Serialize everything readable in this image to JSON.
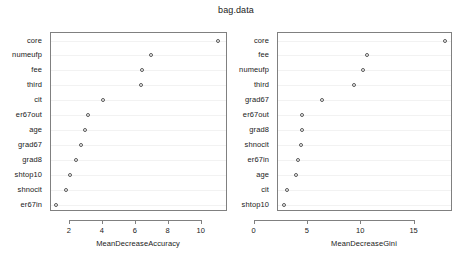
{
  "chart_data": [
    {
      "type": "scatter",
      "panel": "left",
      "title": "bag.data",
      "xlabel": "MeanDecreaseAccuracy",
      "ylabel": "",
      "grid": true,
      "legend": "none",
      "xlim": [
        0.85,
        11.6
      ],
      "xticks": [
        2,
        4,
        6,
        8,
        10
      ],
      "categories": [
        "core",
        "numeufp",
        "fee",
        "third",
        "cit",
        "er67out",
        "age",
        "grad67",
        "grad8",
        "shtop10",
        "shnocit",
        "er67in"
      ],
      "values": [
        11.0,
        6.9,
        6.4,
        6.3,
        4.0,
        3.1,
        2.9,
        2.65,
        2.35,
        2.0,
        1.75,
        1.15
      ]
    },
    {
      "type": "scatter",
      "panel": "right",
      "title": "bag.data",
      "xlabel": "MeanDecreaseGini",
      "ylabel": "",
      "grid": true,
      "legend": "none",
      "xlim": [
        2.2,
        18.6
      ],
      "xticks": [
        0,
        5,
        10,
        15
      ],
      "categories": [
        "core",
        "fee",
        "numeufp",
        "third",
        "grad67",
        "er67out",
        "grad8",
        "shnocit",
        "er67in",
        "age",
        "cit",
        "shtop10"
      ],
      "values": [
        17.8,
        10.5,
        10.2,
        9.3,
        6.3,
        4.45,
        4.4,
        4.35,
        4.1,
        3.9,
        3.0,
        2.8
      ]
    }
  ],
  "title": "bag.data",
  "left_panel": {
    "xlabel": "MeanDecreaseAccuracy",
    "xticks": [
      "2",
      "4",
      "6",
      "8",
      "10"
    ],
    "ylabels": [
      "core",
      "numeufp",
      "fee",
      "third",
      "cit",
      "er67out",
      "age",
      "grad67",
      "grad8",
      "shtop10",
      "shnocit",
      "er67in"
    ]
  },
  "right_panel": {
    "xlabel": "MeanDecreaseGini",
    "xticks": [
      "0",
      "5",
      "10",
      "15"
    ],
    "ylabels": [
      "core",
      "fee",
      "numeufp",
      "third",
      "grad67",
      "er67out",
      "grad8",
      "shnocit",
      "er67in",
      "age",
      "cit",
      "shtop10"
    ]
  },
  "colors": {
    "background": "#ffffff",
    "axis": "#808080",
    "text": "#1a1a1a",
    "point": "#595959",
    "grid": "#f2f2f2"
  }
}
